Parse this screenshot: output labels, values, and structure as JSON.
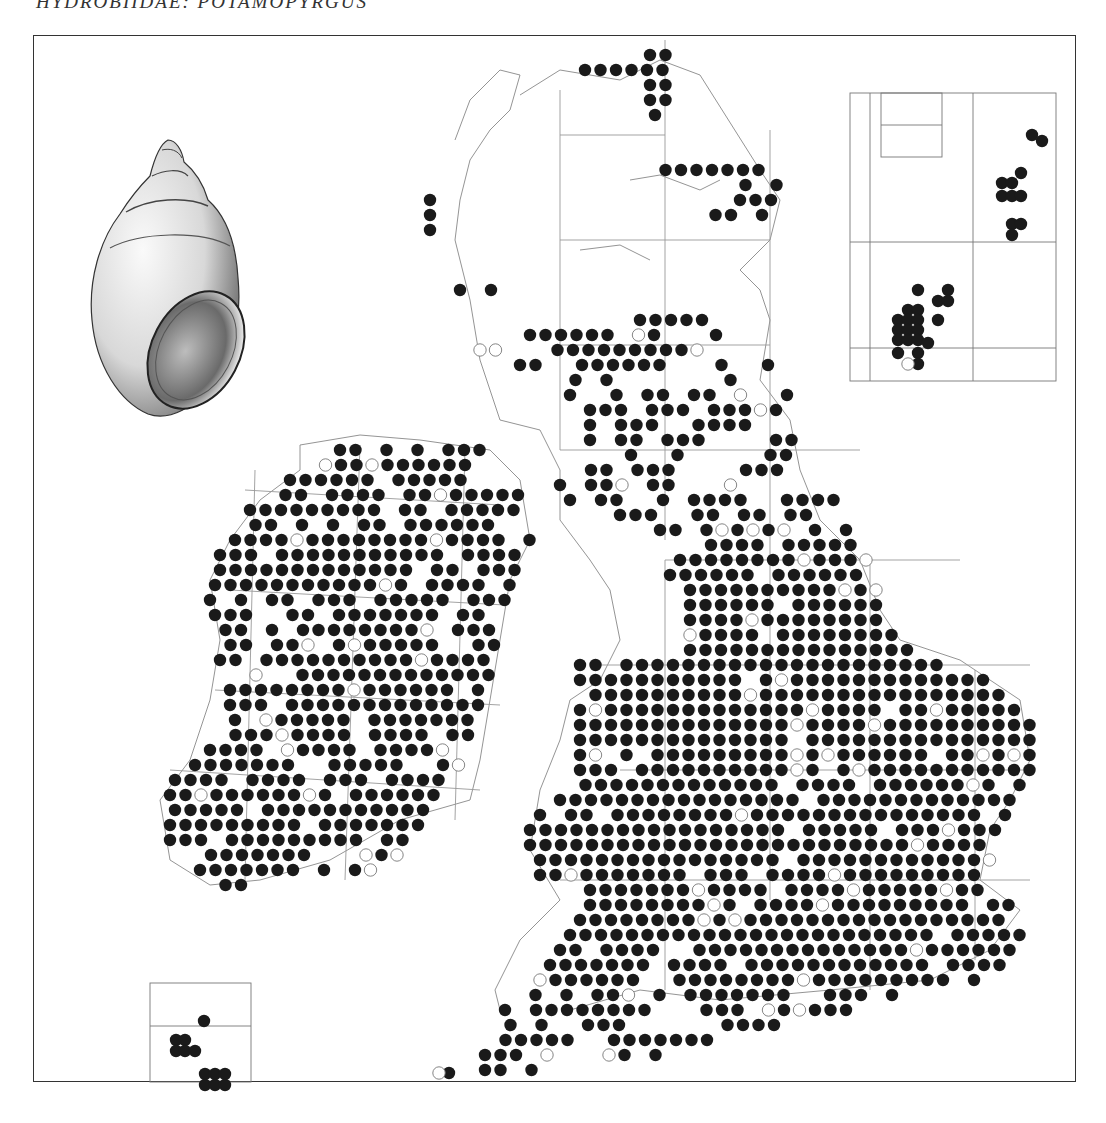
{
  "title": "HYDROBIIDAE: POTAMOPYRGUS",
  "colors": {
    "dot_filled": "#1a1a1a",
    "dot_open_stroke": "#777777",
    "grid_line": "#888888",
    "frame": "#333333",
    "coast": "#777777"
  },
  "map": {
    "type": "distribution-dot-map",
    "region": "Britain and Ireland",
    "legend": {
      "filled_dot": "recorded (recent)",
      "open_dot": "recorded (older)"
    },
    "dot_spacing_px": 15.5,
    "dot_radius_px": 6.2
  },
  "illustration": {
    "name": "shell-illustration",
    "subject": "spired freshwater snail shell"
  },
  "insets": [
    {
      "name": "shetland-inset",
      "position": "top-right"
    },
    {
      "name": "channel-islands-inset",
      "position": "bottom-left"
    }
  ]
}
